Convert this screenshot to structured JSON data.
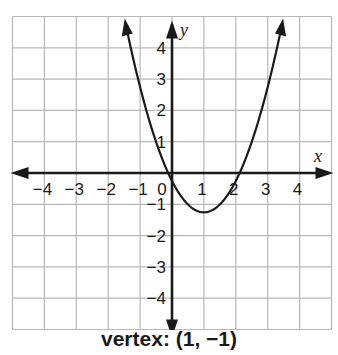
{
  "chart_data": {
    "type": "line",
    "title": "",
    "function": "y = x^2 - 2x",
    "xlabel": "x",
    "ylabel": "y",
    "xlim": [
      -5,
      5
    ],
    "ylim": [
      -5,
      5
    ],
    "grid": true,
    "x_ticks": [
      "-4",
      "-3",
      "-2",
      "-1",
      "0",
      "1",
      "2",
      "3",
      "4"
    ],
    "y_ticks": [
      "4",
      "3",
      "2",
      "1",
      "-1",
      "-2",
      "-3",
      "-4"
    ],
    "series": [
      {
        "name": "parabola",
        "x": [
          -1.45,
          -1,
          -0.5,
          0,
          0.5,
          1,
          1.5,
          2,
          2.5,
          3,
          3.45
        ],
        "y": [
          5,
          3,
          1.25,
          0,
          -0.75,
          -1,
          -0.75,
          0,
          1.25,
          3,
          5
        ]
      }
    ],
    "annotations": [
      {
        "text": "vertex: (1, −1)",
        "position": "below-chart"
      }
    ],
    "vertex": [
      1,
      -1
    ],
    "x_intercepts": [
      0,
      2
    ]
  },
  "caption": "vertex: (1, −1)",
  "colors": {
    "grid": "#b8b8b8",
    "axis": "#1a1a1a",
    "curve": "#1a1a1a"
  }
}
